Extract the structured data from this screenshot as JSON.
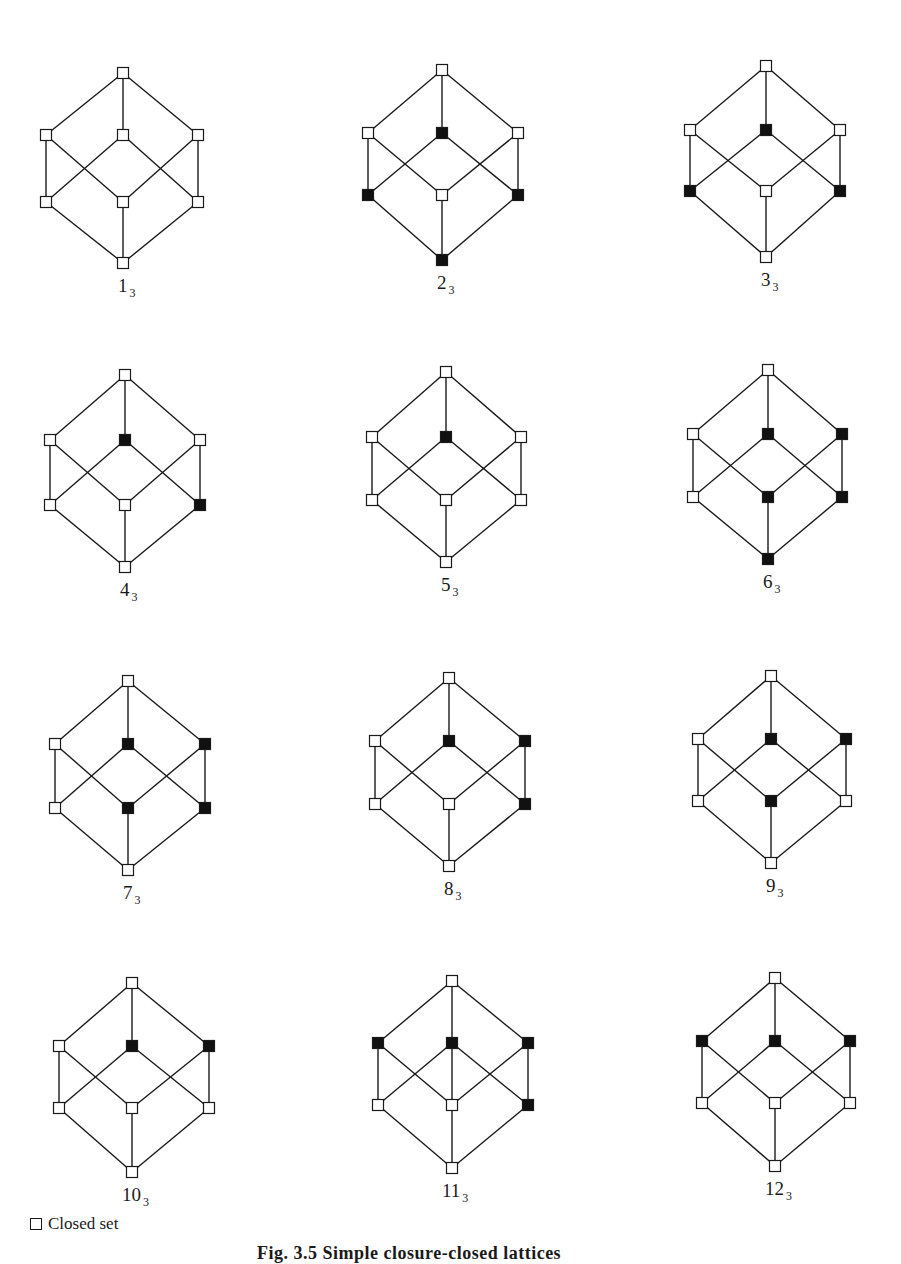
{
  "figure": {
    "caption": "Fig. 3.5  Simple closure-closed lattices",
    "legend": {
      "open_symbol_label": "Closed set"
    },
    "node_order": [
      "top",
      "upper_left",
      "upper_mid",
      "upper_right",
      "lower_left",
      "lower_mid",
      "lower_right",
      "bottom"
    ],
    "base_edges": [
      [
        "top",
        "upper_left"
      ],
      [
        "top",
        "upper_mid"
      ],
      [
        "top",
        "upper_right"
      ],
      [
        "upper_left",
        "lower_left"
      ],
      [
        "upper_left",
        "lower_mid"
      ],
      [
        "upper_mid",
        "lower_left"
      ],
      [
        "upper_mid",
        "lower_right"
      ],
      [
        "upper_right",
        "lower_mid"
      ],
      [
        "upper_right",
        "lower_right"
      ],
      [
        "lower_left",
        "bottom"
      ],
      [
        "lower_mid",
        "bottom"
      ],
      [
        "lower_right",
        "bottom"
      ]
    ],
    "diagrams": [
      {
        "label": "1",
        "subscript": "3",
        "cx": 123,
        "left": 46,
        "right": 198,
        "y": [
          73,
          135,
          202,
          263
        ],
        "filled": [],
        "extra_edges": []
      },
      {
        "label": "2",
        "subscript": "3",
        "cx": 442,
        "left": 368,
        "right": 518,
        "y": [
          70,
          133,
          195,
          260
        ],
        "filled": [
          "upper_mid",
          "lower_left",
          "lower_right",
          "bottom"
        ],
        "extra_edges": []
      },
      {
        "label": "3",
        "subscript": "3",
        "cx": 766,
        "left": 690,
        "right": 840,
        "y": [
          66,
          130,
          191,
          257
        ],
        "filled": [
          "upper_mid",
          "lower_left",
          "lower_right"
        ],
        "extra_edges": []
      },
      {
        "label": "4",
        "subscript": "3",
        "cx": 125,
        "left": 50,
        "right": 200,
        "y": [
          375,
          440,
          505,
          567
        ],
        "filled": [
          "upper_mid",
          "lower_right"
        ],
        "extra_edges": []
      },
      {
        "label": "5",
        "subscript": "3",
        "cx": 446,
        "left": 372,
        "right": 521,
        "y": [
          372,
          437,
          500,
          562
        ],
        "filled": [
          "upper_mid"
        ],
        "extra_edges": []
      },
      {
        "label": "6",
        "subscript": "3",
        "cx": 768,
        "left": 693,
        "right": 842,
        "y": [
          370,
          434,
          497,
          559
        ],
        "filled": [
          "upper_mid",
          "upper_right",
          "lower_mid",
          "lower_right",
          "bottom"
        ],
        "extra_edges": []
      },
      {
        "label": "7",
        "subscript": "3",
        "cx": 128,
        "left": 55,
        "right": 205,
        "y": [
          681,
          744,
          808,
          870
        ],
        "filled": [
          "upper_mid",
          "upper_right",
          "lower_mid",
          "lower_right"
        ],
        "extra_edges": []
      },
      {
        "label": "8",
        "subscript": "3",
        "cx": 449,
        "left": 375,
        "right": 525,
        "y": [
          678,
          741,
          804,
          866
        ],
        "filled": [
          "upper_mid",
          "upper_right",
          "lower_right"
        ],
        "extra_edges": []
      },
      {
        "label": "9",
        "subscript": "3",
        "cx": 771,
        "left": 698,
        "right": 846,
        "y": [
          676,
          739,
          801,
          863
        ],
        "filled": [
          "upper_mid",
          "upper_right",
          "lower_mid"
        ],
        "extra_edges": []
      },
      {
        "label": "10",
        "subscript": "3",
        "cx": 132,
        "left": 59,
        "right": 209,
        "y": [
          983,
          1046,
          1108,
          1172
        ],
        "filled": [
          "upper_mid",
          "upper_right"
        ],
        "extra_edges": []
      },
      {
        "label": "11",
        "subscript": "3",
        "cx": 452,
        "left": 378,
        "right": 528,
        "y": [
          981,
          1043,
          1105,
          1168
        ],
        "filled": [
          "upper_left",
          "upper_mid",
          "upper_right",
          "lower_right"
        ],
        "extra_edges": [
          [
            "upper_mid",
            "lower_mid"
          ]
        ]
      },
      {
        "label": "12",
        "subscript": "3",
        "cx": 775,
        "left": 702,
        "right": 850,
        "y": [
          978,
          1041,
          1103,
          1166
        ],
        "filled": [
          "upper_left",
          "upper_mid",
          "upper_right"
        ],
        "extra_edges": []
      }
    ]
  },
  "colors": {
    "line": "#1a1a1a",
    "closed_fill": "#111111",
    "open_fill": "#ffffff",
    "background": "#ffffff"
  }
}
